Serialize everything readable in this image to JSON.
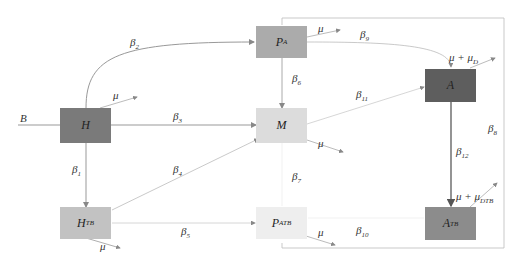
{
  "diagram": {
    "type": "compartmental-model",
    "nodes": [
      {
        "id": "H",
        "label": "H",
        "sub": "",
        "color": "#7a7a7a"
      },
      {
        "id": "HTB",
        "label": "H",
        "sub": "TB",
        "color": "#bdbdbd"
      },
      {
        "id": "PA",
        "label": "P",
        "sub": "A",
        "color": "#a8a8a8"
      },
      {
        "id": "M",
        "label": "M",
        "sub": "",
        "color": "#d9d9d9"
      },
      {
        "id": "PATB",
        "label": "P",
        "sub": "ATB",
        "color": "#ececec"
      },
      {
        "id": "A",
        "label": "A",
        "sub": "",
        "color": "#5e5e5e"
      },
      {
        "id": "ATB",
        "label": "A",
        "sub": "TB",
        "color": "#8a8a8a"
      }
    ],
    "labels": {
      "B": "B",
      "beta1": {
        "base": "β",
        "sub": "1"
      },
      "beta2": {
        "base": "β",
        "sub": "2"
      },
      "beta3": {
        "base": "β",
        "sub": "3"
      },
      "beta4": {
        "base": "β",
        "sub": "4"
      },
      "beta5": {
        "base": "β",
        "sub": "5"
      },
      "beta6": {
        "base": "β",
        "sub": "6"
      },
      "beta7": {
        "base": "β",
        "sub": "7"
      },
      "beta8": {
        "base": "β",
        "sub": "8"
      },
      "beta9": {
        "base": "β",
        "sub": "9"
      },
      "beta10": {
        "base": "β",
        "sub": "10"
      },
      "beta11": {
        "base": "β",
        "sub": "11"
      },
      "beta12": {
        "base": "β",
        "sub": "12"
      },
      "mu": "μ",
      "mu_A": {
        "base": "μ + μ",
        "sub": "D"
      },
      "mu_ATB": {
        "base": "μ + μ",
        "sub": "DTB"
      }
    }
  }
}
